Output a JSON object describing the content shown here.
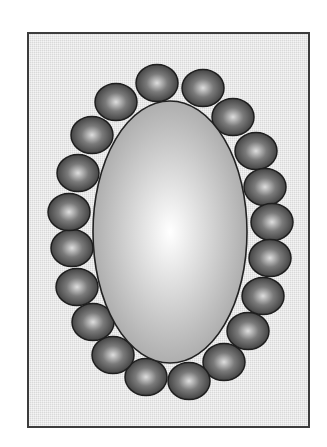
{
  "diagram": {
    "type": "necklace-illustration",
    "colors": {
      "page_background": "#ffffff",
      "frame_fill": "#e9e9e9",
      "frame_border": "#3c3c3c",
      "pendant_center": "#ffffff",
      "pendant_edge": "#a6a6a6",
      "pendant_outline": "#222222",
      "bead_highlight": "#dedede",
      "bead_mid": "#7a7a7a",
      "bead_edge": "#3a3a3a",
      "bead_outline": "#1e1e1e"
    },
    "frame": {
      "x": 28,
      "y": 33,
      "width": 281,
      "height": 394,
      "stroke_width": 2
    },
    "pendant": {
      "shape": "ellipse",
      "cx": 170,
      "cy": 232,
      "rx": 77,
      "ry": 131
    },
    "bead_size": {
      "rx": 21,
      "ry": 18.5
    },
    "beads": [
      {
        "cx": 157,
        "cy": 83
      },
      {
        "cx": 203,
        "cy": 88
      },
      {
        "cx": 233,
        "cy": 117
      },
      {
        "cx": 256,
        "cy": 151
      },
      {
        "cx": 265,
        "cy": 187
      },
      {
        "cx": 272,
        "cy": 222
      },
      {
        "cx": 270,
        "cy": 258
      },
      {
        "cx": 263,
        "cy": 296
      },
      {
        "cx": 248,
        "cy": 331
      },
      {
        "cx": 224,
        "cy": 362
      },
      {
        "cx": 189,
        "cy": 381
      },
      {
        "cx": 146,
        "cy": 377
      },
      {
        "cx": 113,
        "cy": 355
      },
      {
        "cx": 93,
        "cy": 322
      },
      {
        "cx": 77,
        "cy": 287
      },
      {
        "cx": 72,
        "cy": 248
      },
      {
        "cx": 69,
        "cy": 212
      },
      {
        "cx": 78,
        "cy": 173
      },
      {
        "cx": 92,
        "cy": 135
      },
      {
        "cx": 116,
        "cy": 102
      }
    ],
    "bead_count": 20
  }
}
